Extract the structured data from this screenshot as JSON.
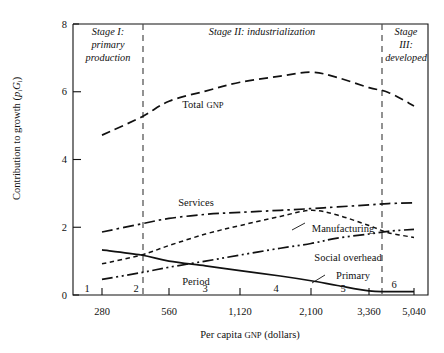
{
  "chart_data": {
    "type": "line",
    "title": "",
    "xlabel": "Per capita GNP (dollars)",
    "ylabel": "Contribution to growth (pᵢGᵢ)",
    "ylabel_main": "Contribution to growth (",
    "ylabel_p": "p",
    "ylabel_sub_i1": "i",
    "ylabel_G": "G",
    "ylabel_sub_i2": "i",
    "ylabel_close": ")",
    "ylim": [
      0,
      8
    ],
    "yticks": [
      0,
      2,
      4,
      6,
      8
    ],
    "yticklabels": [
      "0",
      "2",
      "4",
      "6",
      "8"
    ],
    "xticks": [
      280,
      560,
      1120,
      2100,
      3360,
      5040
    ],
    "xticklabels": [
      "280",
      "560",
      "1,120",
      "2,100",
      "3,360",
      "5,040"
    ],
    "xscale": "log-like-category",
    "grid": false,
    "legend": "inline-annotations",
    "period_label": "Period",
    "period_numbers": [
      "1",
      "2",
      "3",
      "4",
      "5",
      "6"
    ],
    "stage_dividers": [
      420,
      4000
    ],
    "stages": [
      {
        "id": "stage-1",
        "lines": [
          "Stage I:",
          "primary",
          "production"
        ]
      },
      {
        "id": "stage-2",
        "lines": [
          "Stage II: industrialization"
        ]
      },
      {
        "id": "stage-3",
        "lines": [
          "Stage",
          "III:",
          "developed"
        ]
      }
    ],
    "series": [
      {
        "name": "Total GNP",
        "label_main": "Total ",
        "label_smallcaps": "GNP",
        "style": "dashed",
        "points": [
          [
            280,
            4.72
          ],
          [
            420,
            5.25
          ],
          [
            560,
            5.72
          ],
          [
            800,
            6.02
          ],
          [
            1120,
            6.28
          ],
          [
            1600,
            6.46
          ],
          [
            2100,
            6.58
          ],
          [
            2600,
            6.42
          ],
          [
            3360,
            6.12
          ],
          [
            4000,
            5.98
          ],
          [
            5040,
            5.58
          ]
        ]
      },
      {
        "name": "Services",
        "label_main": "Services",
        "style": "dash-dot",
        "points": [
          [
            280,
            1.86
          ],
          [
            420,
            2.1
          ],
          [
            560,
            2.26
          ],
          [
            800,
            2.38
          ],
          [
            1120,
            2.44
          ],
          [
            1600,
            2.5
          ],
          [
            2100,
            2.55
          ],
          [
            2600,
            2.6
          ],
          [
            3360,
            2.66
          ],
          [
            4000,
            2.7
          ],
          [
            5040,
            2.72
          ]
        ]
      },
      {
        "name": "Manufacturing",
        "label_main": "Manufacturing",
        "style": "fine-dashed",
        "points": [
          [
            280,
            0.92
          ],
          [
            420,
            1.18
          ],
          [
            560,
            1.46
          ],
          [
            800,
            1.8
          ],
          [
            1120,
            2.05
          ],
          [
            1600,
            2.32
          ],
          [
            2100,
            2.5
          ],
          [
            2600,
            2.36
          ],
          [
            3360,
            2.05
          ],
          [
            4000,
            1.84
          ],
          [
            5040,
            1.7
          ]
        ]
      },
      {
        "name": "Social overhead",
        "label_main": "Social overhead",
        "style": "dash-dot-dot",
        "points": [
          [
            280,
            0.46
          ],
          [
            420,
            0.66
          ],
          [
            560,
            0.82
          ],
          [
            800,
            1.0
          ],
          [
            1120,
            1.18
          ],
          [
            1600,
            1.38
          ],
          [
            2100,
            1.52
          ],
          [
            2600,
            1.68
          ],
          [
            3360,
            1.8
          ],
          [
            4000,
            1.88
          ],
          [
            5040,
            1.94
          ]
        ]
      },
      {
        "name": "Primary",
        "label_main": "Primary",
        "style": "solid",
        "points": [
          [
            280,
            1.33
          ],
          [
            420,
            1.18
          ],
          [
            560,
            1.0
          ],
          [
            800,
            0.86
          ],
          [
            1120,
            0.72
          ],
          [
            1600,
            0.56
          ],
          [
            2100,
            0.42
          ],
          [
            2600,
            0.28
          ],
          [
            3360,
            0.12
          ],
          [
            4000,
            0.1
          ],
          [
            5040,
            0.1
          ]
        ]
      }
    ]
  }
}
